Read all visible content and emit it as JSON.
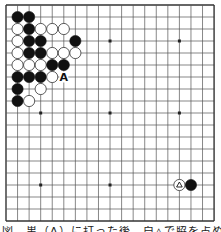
{
  "board": {
    "size": 19,
    "origin_x": 6,
    "origin_y": 5,
    "step_x": 11.56,
    "step_y": 12,
    "line_color": "#555555",
    "border_color": "#333333",
    "background": "#ffffff",
    "star_points": [
      [
        3,
        3
      ],
      [
        9,
        3
      ],
      [
        15,
        3
      ],
      [
        3,
        9
      ],
      [
        9,
        9
      ],
      [
        15,
        9
      ],
      [
        3,
        15
      ],
      [
        9,
        15
      ],
      [
        15,
        15
      ]
    ],
    "stones": [
      {
        "col": 1,
        "row": 1,
        "color": "black"
      },
      {
        "col": 2,
        "row": 1,
        "color": "black"
      },
      {
        "col": 1,
        "row": 2,
        "color": "white"
      },
      {
        "col": 2,
        "row": 2,
        "color": "black"
      },
      {
        "col": 3,
        "row": 2,
        "color": "white"
      },
      {
        "col": 4,
        "row": 2,
        "color": "white"
      },
      {
        "col": 5,
        "row": 2,
        "color": "white"
      },
      {
        "col": 1,
        "row": 3,
        "color": "white"
      },
      {
        "col": 2,
        "row": 3,
        "color": "black"
      },
      {
        "col": 3,
        "row": 3,
        "color": "black"
      },
      {
        "col": 6,
        "row": 3,
        "color": "black"
      },
      {
        "col": 1,
        "row": 4,
        "color": "white"
      },
      {
        "col": 2,
        "row": 4,
        "color": "black"
      },
      {
        "col": 3,
        "row": 4,
        "color": "black"
      },
      {
        "col": 4,
        "row": 4,
        "color": "white"
      },
      {
        "col": 5,
        "row": 4,
        "color": "white"
      },
      {
        "col": 6,
        "row": 4,
        "color": "white"
      },
      {
        "col": 1,
        "row": 5,
        "color": "white"
      },
      {
        "col": 2,
        "row": 5,
        "color": "white"
      },
      {
        "col": 3,
        "row": 5,
        "color": "white"
      },
      {
        "col": 4,
        "row": 5,
        "color": "black"
      },
      {
        "col": 5,
        "row": 5,
        "color": "black"
      },
      {
        "col": 1,
        "row": 6,
        "color": "black"
      },
      {
        "col": 2,
        "row": 6,
        "color": "black"
      },
      {
        "col": 3,
        "row": 6,
        "color": "black"
      },
      {
        "col": 4,
        "row": 6,
        "color": "white"
      },
      {
        "col": 1,
        "row": 7,
        "color": "black"
      },
      {
        "col": 3,
        "row": 7,
        "color": "white"
      },
      {
        "col": 1,
        "row": 8,
        "color": "black"
      },
      {
        "col": 2,
        "row": 8,
        "color": "white"
      },
      {
        "col": 15,
        "row": 15,
        "color": "white",
        "mark": "triangle"
      },
      {
        "col": 16,
        "row": 15,
        "color": "black"
      }
    ],
    "labels": [
      {
        "col": 5,
        "row": 6,
        "text": "A"
      }
    ]
  },
  "caption": {
    "text": "図　黒（A）に打った後、白△で脇を占める形"
  }
}
